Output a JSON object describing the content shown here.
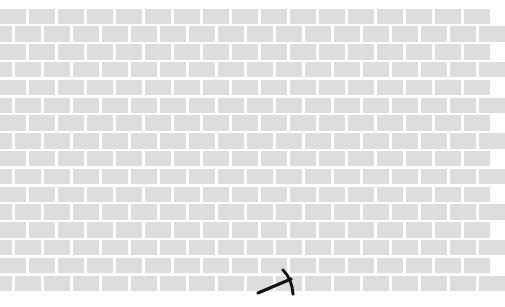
{
  "game": {
    "title": "Brick wall",
    "background_color": "#ffffff",
    "brick_color": "#dddddd",
    "mortar_color": "#ffffff"
  },
  "wall": {
    "rows": 16,
    "top": 8.5,
    "row_pitch": 17.8,
    "brick_height": 15.5,
    "brick_width": 26,
    "col_pitch": 29,
    "even_row_offset": 0,
    "odd_row_offset": -14.5
  },
  "cursor": {
    "icon": "pickaxe-icon",
    "color": "#111111",
    "x": 258,
    "y": 270
  }
}
